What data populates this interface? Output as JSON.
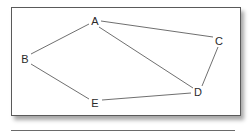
{
  "diagram": {
    "type": "undirected-graph",
    "nodes": [
      {
        "id": "A",
        "label": "A",
        "x": 95,
        "y": 21
      },
      {
        "id": "B",
        "label": "B",
        "x": 25,
        "y": 59
      },
      {
        "id": "C",
        "label": "C",
        "x": 219,
        "y": 41
      },
      {
        "id": "D",
        "label": "D",
        "x": 198,
        "y": 92
      },
      {
        "id": "E",
        "label": "E",
        "x": 95,
        "y": 103
      }
    ],
    "edges": [
      {
        "from": "A",
        "to": "B"
      },
      {
        "from": "A",
        "to": "C"
      },
      {
        "from": "A",
        "to": "D"
      },
      {
        "from": "C",
        "to": "D"
      },
      {
        "from": "B",
        "to": "E"
      },
      {
        "from": "E",
        "to": "D"
      }
    ],
    "colors": {
      "edge": "#4a4a4a",
      "label": "#2a2a2a",
      "frame_border": "#5a5a5a",
      "background": "#ffffff"
    }
  }
}
